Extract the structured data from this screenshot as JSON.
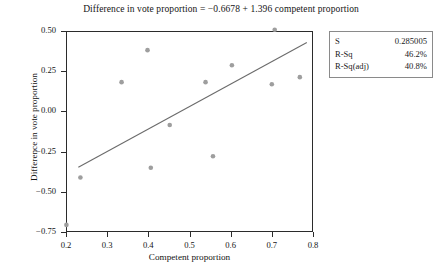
{
  "chart_data": {
    "type": "scatter",
    "title": "Difference in vote proportion = −0.6678 + 1.396 competent proportion",
    "xlabel": "Competent proportion",
    "ylabel": "Difference in vote proportion",
    "xlim": [
      0.2,
      0.8
    ],
    "ylim": [
      -0.75,
      0.5
    ],
    "xticks": [
      "0.2",
      "0.3",
      "0.4",
      "0.5",
      "0.6",
      "0.7",
      "0.8"
    ],
    "xtick_values": [
      0.2,
      0.3,
      0.4,
      0.5,
      0.6,
      0.7,
      0.8
    ],
    "yticks": [
      "0.50",
      "0.25",
      "0.00",
      "−0.25",
      "−0.50",
      "−0.75"
    ],
    "ytick_values": [
      0.5,
      0.25,
      0.0,
      -0.25,
      -0.5,
      -0.75
    ],
    "grid": false,
    "legend": "none",
    "marker_color": "#9e9e9e",
    "line_color": "#6b6b6b",
    "axis_color": "#2b2b2b",
    "points": [
      {
        "x": 0.201,
        "y": -0.706
      },
      {
        "x": 0.235,
        "y": -0.411
      },
      {
        "x": 0.335,
        "y": 0.182
      },
      {
        "x": 0.398,
        "y": 0.381
      },
      {
        "x": 0.406,
        "y": -0.35
      },
      {
        "x": 0.452,
        "y": -0.085
      },
      {
        "x": 0.539,
        "y": 0.182
      },
      {
        "x": 0.557,
        "y": -0.279
      },
      {
        "x": 0.603,
        "y": 0.287
      },
      {
        "x": 0.7,
        "y": 0.169
      },
      {
        "x": 0.707,
        "y": 0.508
      },
      {
        "x": 0.768,
        "y": 0.213
      }
    ],
    "fit_line": {
      "intercept": -0.6678,
      "slope": 1.396,
      "x_start": 0.23,
      "x_end": 0.785,
      "y_start": -0.3467,
      "y_end": 0.4281
    },
    "stats": {
      "s_label": "S",
      "s_value": "0.285005",
      "rsq_label": "R-Sq",
      "rsq_value": "46.2%",
      "rsqadj_label": "R-Sq(adj)",
      "rsqadj_value": "40.8%"
    }
  }
}
